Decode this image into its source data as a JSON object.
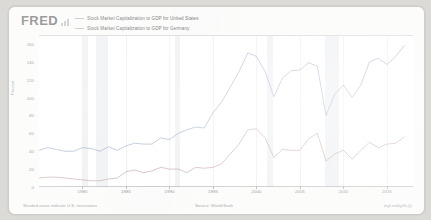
{
  "brand": {
    "logo_text": "FRED",
    "logo_mark_icon": "bar-chart-icon"
  },
  "legend": {
    "position": "top-left",
    "entries": [
      {
        "label": "Stock Market Capitalization to GDP for United States",
        "color": "#7e93b8"
      },
      {
        "label": "Stock Market Capitalization to GDP for Germany",
        "color": "#b58c8c"
      }
    ]
  },
  "footer": {
    "left": "Shaded areas indicate U.S. recessions",
    "source": "Source: World Bank",
    "permalink": "myf.red/g/hLjQ"
  },
  "chart_data": {
    "type": "line",
    "title": "",
    "subtitle": "",
    "xlabel": "",
    "ylabel": "Percent",
    "ylim": [
      0,
      170
    ],
    "xlim": [
      1975,
      2018
    ],
    "grid": true,
    "legend_position": "top-left",
    "y_ticks": [
      0,
      20,
      40,
      60,
      80,
      100,
      120,
      140,
      160
    ],
    "x_ticks": [
      1980,
      1985,
      1990,
      1995,
      2000,
      2005,
      2010,
      2015
    ],
    "recession_bands": [
      {
        "start": 1980.0,
        "end": 1980.6
      },
      {
        "start": 1981.6,
        "end": 1982.9
      },
      {
        "start": 1990.6,
        "end": 1991.2
      },
      {
        "start": 2001.2,
        "end": 2001.9
      },
      {
        "start": 2007.9,
        "end": 2009.5
      }
    ],
    "x": [
      1975,
      1976,
      1977,
      1978,
      1979,
      1980,
      1981,
      1982,
      1983,
      1984,
      1985,
      1986,
      1987,
      1988,
      1989,
      1990,
      1991,
      1992,
      1993,
      1994,
      1995,
      1996,
      1997,
      1998,
      1999,
      2000,
      2001,
      2002,
      2003,
      2004,
      2005,
      2006,
      2007,
      2008,
      2009,
      2010,
      2011,
      2012,
      2013,
      2014,
      2015,
      2016,
      2017
    ],
    "series": [
      {
        "name": "Stock Market Capitalization to GDP for United States",
        "color": "#7e93b8",
        "values": [
          41,
          44,
          42,
          40,
          40,
          44,
          43,
          40,
          45,
          41,
          46,
          49,
          48,
          48,
          55,
          53,
          60,
          64,
          67,
          66,
          83,
          95,
          112,
          129,
          150,
          146,
          129,
          101,
          122,
          130,
          131,
          139,
          135,
          80,
          104,
          114,
          100,
          114,
          140,
          144,
          137,
          146,
          158
        ]
      },
      {
        "name": "Stock Market Capitalization to GDP for Germany",
        "color": "#b58c8c",
        "values": [
          10,
          11,
          11,
          10,
          9,
          8,
          7,
          7,
          9,
          10,
          17,
          19,
          16,
          18,
          22,
          20,
          20,
          16,
          22,
          21,
          22,
          26,
          37,
          48,
          64,
          65,
          55,
          33,
          42,
          41,
          41,
          54,
          60,
          29,
          37,
          41,
          31,
          41,
          50,
          44,
          48,
          49,
          56
        ]
      }
    ]
  }
}
